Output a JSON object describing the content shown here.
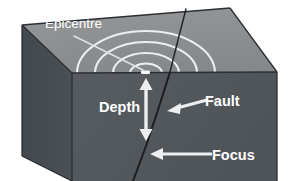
{
  "diagram": {
    "labels": {
      "epicentre": "Epicentre",
      "depth": "Depth",
      "fault": "Fault",
      "focus": "Focus"
    },
    "colors": {
      "background": "#ffffff",
      "top_surface": "#8d8f91",
      "front_face": "#53585d",
      "left_face": "#474c51",
      "edge_line": "#2f3337",
      "fault_line": "#1c1f22",
      "annotation": "#f2f2f2",
      "text": "#ffffff"
    },
    "features": [
      {
        "name": "seismic-waves",
        "description": "Four concentric ripple rings radiating from the epicentre across the top surface",
        "ring_count": 4
      },
      {
        "name": "epicentre-marker",
        "description": "Small white mark on the ground surface directly above the focus"
      },
      {
        "name": "fault-line",
        "description": "Dark fracture plane cutting from the ground surface down through the block"
      },
      {
        "name": "depth-arrow",
        "description": "Vertical double-headed arrow measuring distance from epicentre down to focus"
      },
      {
        "name": "focus-arrow",
        "description": "Arrow pointing to the focus, the point of rupture on the fault"
      },
      {
        "name": "fault-arrow",
        "description": "Arrow pointing to the fault line"
      }
    ]
  }
}
